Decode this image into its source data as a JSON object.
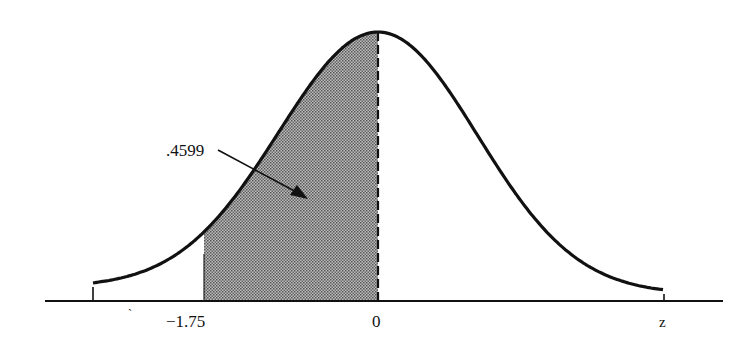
{
  "chart_data": {
    "type": "area",
    "title": "",
    "xlabel": "z",
    "ylabel": "",
    "x_ticks": [
      "-1.75",
      "0"
    ],
    "shaded_region": {
      "from": -1.75,
      "to": 0,
      "area": 0.4599
    },
    "annotation": {
      "text": ".4599",
      "points_to": "shaded region"
    },
    "xlim": [
      -2.9,
      3.4
    ],
    "grid": false,
    "legend": null
  },
  "labels": {
    "area": ".4599",
    "tick_left": "−1.75",
    "tick_zero": "0",
    "axis_z": "z",
    "stray_mark": "`"
  }
}
